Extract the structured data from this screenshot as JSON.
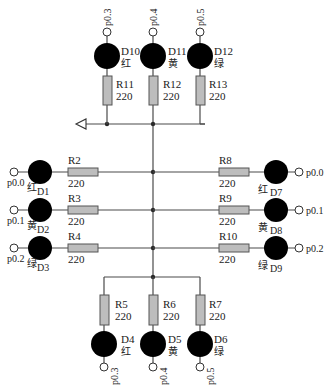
{
  "diagram": {
    "type": "LED matrix circuit schematic",
    "colors": {
      "wire": "#4a4a4a",
      "resistor_fill": "#bdbdbd",
      "led_fill": "#000000",
      "node": "#2a2a2a"
    },
    "top_group": [
      {
        "led": "D10",
        "color_label": "红",
        "resistor": "R11",
        "value": "220",
        "pin": "p0.3"
      },
      {
        "led": "D11",
        "color_label": "黄",
        "resistor": "R12",
        "value": "220",
        "pin": "p0.4"
      },
      {
        "led": "D12",
        "color_label": "绿",
        "resistor": "R13",
        "value": "220",
        "pin": "p0.5"
      }
    ],
    "left_group": [
      {
        "led": "D1",
        "color_label": "红",
        "resistor": "R2",
        "value": "220",
        "pin": "p0.0"
      },
      {
        "led": "D2",
        "color_label": "黄",
        "resistor": "R3",
        "value": "220",
        "pin": "p0.1"
      },
      {
        "led": "D3",
        "color_label": "绿",
        "resistor": "R4",
        "value": "220",
        "pin": "p0.2"
      }
    ],
    "right_group": [
      {
        "led": "D7",
        "color_label": "红",
        "resistor": "R8",
        "value": "220",
        "pin": "p0.0"
      },
      {
        "led": "D8",
        "color_label": "黄",
        "resistor": "R9",
        "value": "220",
        "pin": "p0.1"
      },
      {
        "led": "D9",
        "color_label": "绿",
        "resistor": "R10",
        "value": "220",
        "pin": "p0.2"
      }
    ],
    "bottom_group": [
      {
        "led": "D4",
        "color_label": "红",
        "resistor": "R5",
        "value": "220",
        "pin": "p0.3"
      },
      {
        "led": "D5",
        "color_label": "黄",
        "resistor": "R6",
        "value": "220",
        "pin": "p0.4"
      },
      {
        "led": "D6",
        "color_label": "绿",
        "resistor": "R7",
        "value": "220",
        "pin": "p0.5"
      }
    ],
    "ground_symbol": "ground-arrow"
  }
}
